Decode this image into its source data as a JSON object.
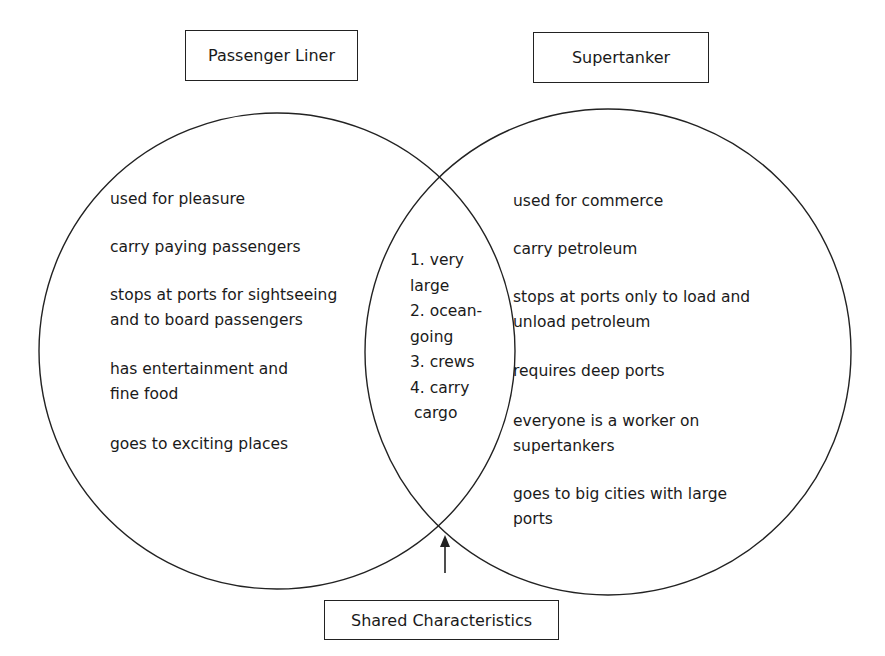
{
  "diagram": {
    "type": "venn",
    "left_set": {
      "title": "Passenger Liner",
      "items": [
        [
          "used for pleasure"
        ],
        [
          "carry paying passengers"
        ],
        [
          "stops at ports for sightseeing",
          "and to board passengers"
        ],
        [
          "has entertainment and",
          "fine food"
        ],
        [
          "goes to exciting places"
        ]
      ]
    },
    "right_set": {
      "title": "Supertanker",
      "items": [
        [
          "used for commerce"
        ],
        [
          "carry petroleum"
        ],
        [
          "stops at ports only to load and",
          "unload petroleum"
        ],
        [
          "requires deep ports"
        ],
        [
          "everyone is a worker on",
          "supertankers"
        ],
        [
          "goes to big cities with large",
          "ports"
        ]
      ]
    },
    "intersection": {
      "title": "Shared Characteristics",
      "lines": [
        "1. very",
        "large",
        "2. ocean-",
        "going",
        "3. crews",
        "4. carry",
        "cargo"
      ]
    },
    "colors": {
      "stroke": "#222222",
      "text": "#1a1a1a",
      "background": "#ffffff"
    }
  }
}
